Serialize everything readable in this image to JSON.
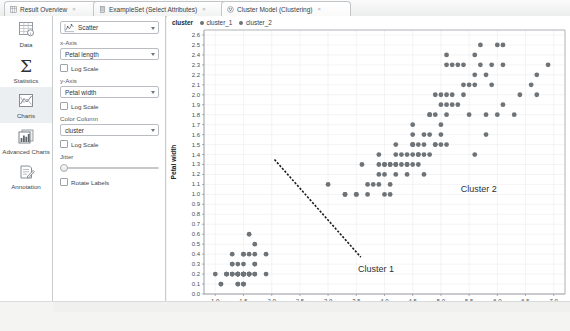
{
  "tabs": [
    {
      "label": "Result Overview",
      "icon": "result-overview-icon",
      "selected": false,
      "close": "×"
    },
    {
      "label": "ExampleSet (Select Attributes)",
      "icon": "dataset-icon",
      "selected": false,
      "close": "×"
    },
    {
      "label": "Cluster Model (Clustering)",
      "icon": "cluster-model-icon",
      "selected": true,
      "close": "×"
    }
  ],
  "rail": [
    {
      "label": "Data",
      "icon": "data-table-icon",
      "active": false
    },
    {
      "label": "Statistics",
      "icon": "sigma-icon",
      "active": false
    },
    {
      "label": "Charts",
      "icon": "charts-icon",
      "active": true
    },
    {
      "label": "Advanced Charts",
      "icon": "advanced-charts-icon",
      "active": false
    },
    {
      "label": "Annotation",
      "icon": "annotation-icon",
      "active": false
    }
  ],
  "panel": {
    "plot_type": "Scatter",
    "x_axis_label": "x-Axis",
    "x_axis_value": "Petal length",
    "x_log_label": "Log Scale",
    "y_axis_label": "y-Axis",
    "y_axis_value": "Petal width",
    "y_log_label": "Log Scale",
    "color_column_label": "Color Column",
    "color_column_value": "cluster",
    "color_log_label": "Log Scale",
    "jitter_label": "Jitter",
    "rotate_labels_label": "Rotate Labels"
  },
  "legend": {
    "title": "cluster",
    "items": [
      {
        "label": "cluster_1",
        "color": "#6e7378"
      },
      {
        "label": "cluster_2",
        "color": "#6e7378"
      }
    ]
  },
  "annotations": [
    {
      "text": "Cluster 1",
      "x": 3.53,
      "y": 0.22
    },
    {
      "text": "Cluster 2",
      "x": 5.35,
      "y": 1.02
    }
  ],
  "chart_data": {
    "type": "scatter",
    "title": "",
    "xlabel": "Petal length",
    "ylabel": "Petal width",
    "xlim": [
      0.8,
      7.2
    ],
    "ylim": [
      0.0,
      2.65
    ],
    "xticks": [
      1.0,
      1.5,
      2.0,
      2.5,
      3.0,
      3.5,
      4.0,
      4.5,
      5.0,
      5.5,
      6.0,
      6.5,
      7.0
    ],
    "yticks": [
      0.0,
      0.1,
      0.2,
      0.3,
      0.4,
      0.5,
      0.6,
      0.7,
      0.8,
      0.9,
      1.0,
      1.1,
      1.2,
      1.3,
      1.4,
      1.5,
      1.6,
      1.7,
      1.8,
      1.9,
      2.0,
      2.1,
      2.2,
      2.3,
      2.4,
      2.5,
      2.6
    ],
    "grid": true,
    "legend_position": "top-left",
    "point_color": "#6e7378",
    "point_size": 2.4,
    "series": [
      {
        "name": "cluster_1",
        "color": "#6e7378",
        "points": [
          [
            1.0,
            0.2
          ],
          [
            1.1,
            0.1
          ],
          [
            1.2,
            0.2
          ],
          [
            1.2,
            0.2
          ],
          [
            1.3,
            0.2
          ],
          [
            1.3,
            0.3
          ],
          [
            1.3,
            0.4
          ],
          [
            1.3,
            0.2
          ],
          [
            1.4,
            0.2
          ],
          [
            1.4,
            0.1
          ],
          [
            1.4,
            0.2
          ],
          [
            1.4,
            0.3
          ],
          [
            1.4,
            0.2
          ],
          [
            1.4,
            0.2
          ],
          [
            1.5,
            0.1
          ],
          [
            1.5,
            0.2
          ],
          [
            1.5,
            0.2
          ],
          [
            1.5,
            0.4
          ],
          [
            1.5,
            0.1
          ],
          [
            1.5,
            0.2
          ],
          [
            1.5,
            0.2
          ],
          [
            1.5,
            0.3
          ],
          [
            1.5,
            0.4
          ],
          [
            1.6,
            0.2
          ],
          [
            1.6,
            0.2
          ],
          [
            1.6,
            0.4
          ],
          [
            1.6,
            0.2
          ],
          [
            1.6,
            0.6
          ],
          [
            1.7,
            0.2
          ],
          [
            1.7,
            0.3
          ],
          [
            1.7,
            0.4
          ],
          [
            1.7,
            0.2
          ],
          [
            1.7,
            0.5
          ],
          [
            1.9,
            0.2
          ],
          [
            1.9,
            0.4
          ],
          [
            1.4,
            0.1
          ],
          [
            1.5,
            0.2
          ],
          [
            1.6,
            0.2
          ],
          [
            1.3,
            0.2
          ],
          [
            1.5,
            0.2
          ],
          [
            1.3,
            0.3
          ],
          [
            1.4,
            0.2
          ],
          [
            1.6,
            0.2
          ],
          [
            1.5,
            0.1
          ],
          [
            1.7,
            0.3
          ],
          [
            1.5,
            0.2
          ],
          [
            1.5,
            0.2
          ],
          [
            1.2,
            0.2
          ],
          [
            1.4,
            0.2
          ],
          [
            1.1,
            0.1
          ]
        ]
      },
      {
        "name": "cluster_2",
        "color": "#6e7378",
        "points": [
          [
            3.0,
            1.1
          ],
          [
            3.3,
            1.0
          ],
          [
            3.3,
            1.0
          ],
          [
            3.5,
            1.0
          ],
          [
            3.5,
            1.0
          ],
          [
            3.6,
            1.3
          ],
          [
            3.7,
            1.0
          ],
          [
            3.8,
            1.1
          ],
          [
            3.9,
            1.2
          ],
          [
            3.9,
            1.4
          ],
          [
            3.9,
            1.1
          ],
          [
            4.0,
            1.0
          ],
          [
            4.0,
            1.3
          ],
          [
            4.0,
            1.3
          ],
          [
            4.1,
            1.0
          ],
          [
            4.1,
            1.3
          ],
          [
            4.1,
            1.3
          ],
          [
            4.2,
            1.3
          ],
          [
            4.2,
            1.2
          ],
          [
            4.2,
            1.3
          ],
          [
            4.2,
            1.5
          ],
          [
            4.3,
            1.3
          ],
          [
            4.4,
            1.2
          ],
          [
            4.4,
            1.4
          ],
          [
            4.4,
            1.3
          ],
          [
            4.5,
            1.3
          ],
          [
            4.5,
            1.5
          ],
          [
            4.5,
            1.5
          ],
          [
            4.5,
            1.6
          ],
          [
            4.5,
            1.5
          ],
          [
            4.5,
            1.7
          ],
          [
            4.6,
            1.3
          ],
          [
            4.6,
            1.4
          ],
          [
            4.6,
            1.5
          ],
          [
            4.7,
            1.4
          ],
          [
            4.7,
            1.2
          ],
          [
            4.7,
            1.6
          ],
          [
            4.8,
            1.4
          ],
          [
            4.8,
            1.8
          ],
          [
            4.8,
            1.8
          ],
          [
            4.9,
            1.5
          ],
          [
            4.9,
            2.0
          ],
          [
            4.9,
            1.8
          ],
          [
            4.9,
            1.5
          ],
          [
            5.0,
            1.7
          ],
          [
            5.0,
            1.5
          ],
          [
            5.0,
            1.9
          ],
          [
            5.0,
            2.0
          ],
          [
            5.1,
            1.5
          ],
          [
            5.1,
            1.9
          ],
          [
            5.1,
            2.0
          ],
          [
            5.1,
            2.4
          ],
          [
            5.1,
            2.3
          ],
          [
            5.1,
            1.8
          ],
          [
            5.2,
            2.0
          ],
          [
            5.2,
            2.3
          ],
          [
            5.3,
            1.9
          ],
          [
            5.3,
            2.3
          ],
          [
            5.4,
            2.1
          ],
          [
            5.4,
            2.3
          ],
          [
            5.5,
            1.8
          ],
          [
            5.5,
            2.1
          ],
          [
            5.6,
            1.4
          ],
          [
            5.6,
            2.1
          ],
          [
            5.6,
            2.4
          ],
          [
            5.6,
            2.2
          ],
          [
            5.7,
            2.3
          ],
          [
            5.7,
            2.5
          ],
          [
            5.8,
            1.6
          ],
          [
            5.8,
            2.2
          ],
          [
            5.8,
            1.8
          ],
          [
            5.9,
            2.1
          ],
          [
            5.9,
            2.3
          ],
          [
            6.0,
            1.8
          ],
          [
            6.0,
            2.5
          ],
          [
            6.1,
            1.9
          ],
          [
            6.1,
            2.3
          ],
          [
            6.1,
            2.5
          ],
          [
            6.3,
            1.8
          ],
          [
            6.4,
            2.0
          ],
          [
            6.6,
            2.1
          ],
          [
            6.7,
            2.2
          ],
          [
            6.7,
            2.0
          ],
          [
            6.9,
            2.3
          ],
          [
            4.0,
            1.2
          ],
          [
            4.4,
            1.3
          ],
          [
            4.5,
            1.4
          ],
          [
            4.7,
            1.5
          ],
          [
            5.0,
            1.6
          ],
          [
            4.2,
            1.4
          ],
          [
            4.6,
            1.4
          ],
          [
            3.9,
            1.3
          ],
          [
            4.8,
            1.6
          ],
          [
            5.2,
            1.9
          ],
          [
            4.3,
            1.4
          ],
          [
            5.4,
            2.0
          ],
          [
            4.1,
            1.1
          ],
          [
            3.7,
            1.1
          ]
        ]
      }
    ],
    "separator_line": {
      "x1": 2.05,
      "y1": 1.35,
      "x2": 3.58,
      "y2": 0.37,
      "style": "dashed",
      "color": "#1a1a1a"
    }
  }
}
